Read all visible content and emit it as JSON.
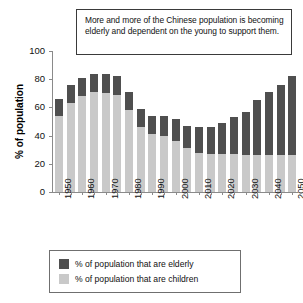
{
  "annotation": {
    "text": "More and more of the Chinese population is becoming elderly and dependent on the young to support them."
  },
  "legend": {
    "position": "below-plot",
    "items": [
      {
        "key": "elderly",
        "label": "% of population that are elderly",
        "color": "#4f4f4f"
      },
      {
        "key": "children",
        "label": "% of population that are children",
        "color": "#c9c9c9"
      }
    ]
  },
  "chart_data": {
    "type": "bar",
    "stacked": true,
    "title": "",
    "subtitle": "",
    "xlabel": "",
    "ylabel": "% of population",
    "ylim": [
      0,
      100
    ],
    "yticks": [
      0,
      20,
      40,
      60,
      80,
      100
    ],
    "grid": false,
    "annotations": [
      "More and more of the Chinese population is becoming elderly and dependent on the young to support them."
    ],
    "categories": [
      "1950",
      "1955",
      "1960",
      "1965",
      "1970",
      "1975",
      "1980",
      "1985",
      "1990",
      "1995",
      "2000",
      "2005",
      "2010",
      "2015",
      "2020",
      "2025",
      "2030",
      "2035",
      "2040",
      "2045",
      "2050"
    ],
    "xtick_labels": [
      "1950",
      "",
      "1960",
      "",
      "1970",
      "",
      "1980",
      "",
      "1990",
      "",
      "2000",
      "",
      "2010",
      "",
      "2020",
      "",
      "2030",
      "",
      "2040",
      "",
      "2050"
    ],
    "series": [
      {
        "name": "% of population that are children",
        "color": "#c9c9c9",
        "values": [
          54,
          63,
          68,
          71,
          70,
          69,
          58,
          46,
          41,
          40,
          36,
          31,
          28,
          27,
          27,
          27,
          26,
          26,
          26,
          26,
          26
        ]
      },
      {
        "name": "% of population that are elderly",
        "color": "#4f4f4f",
        "values": [
          12,
          13,
          13,
          13,
          14,
          13,
          13,
          13,
          13,
          14,
          16,
          16,
          18,
          19,
          22,
          26,
          31,
          39,
          45,
          50,
          56
        ]
      }
    ],
    "totals": [
      66,
      76,
      81,
      84,
      84,
      82,
      71,
      59,
      54,
      54,
      52,
      47,
      46,
      46,
      49,
      53,
      57,
      65,
      71,
      76,
      82
    ]
  },
  "axis": {
    "y_tick_labels": [
      "100",
      "80",
      "60",
      "40",
      "20",
      "0"
    ]
  }
}
